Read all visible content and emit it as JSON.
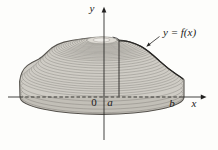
{
  "figure": {
    "kind": "calculus-solid-of-revolution",
    "labels": {
      "y_axis": "y",
      "x_axis": "x",
      "origin": "0",
      "a_point": "a",
      "b_point": "b",
      "curve": "y = f(x)"
    },
    "colors": {
      "background": "#fdfdfb",
      "solid_fill": "#cfccc5",
      "band_shade": "rgba(84,79,70,0.10)",
      "top_plateau": "#dedbd4",
      "top_highlight": "#eeece7",
      "shell_line": "#8f8c86",
      "outline": "#57544f",
      "curve_line": "#262523",
      "axis": "#222120",
      "label": "#1c1b1a"
    },
    "shells": {
      "count": 30,
      "r_min": 16,
      "r_max": 82
    }
  }
}
